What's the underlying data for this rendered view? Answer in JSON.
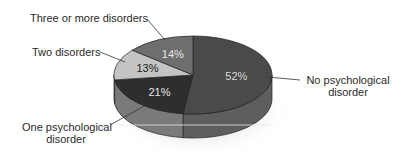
{
  "chart_data": {
    "type": "pie",
    "style": "3d",
    "title": "",
    "slices": [
      {
        "label": "No psychological disorder",
        "value": 52,
        "display": "52%",
        "color": "#4a4a4a",
        "side": "#5e5e5e",
        "text_color": "#d9d9d9"
      },
      {
        "label": "One psychological disorder",
        "value": 21,
        "display": "21%",
        "color": "#2e2e2e",
        "side": "#7a7a7a",
        "text_color": "#e6e6e6"
      },
      {
        "label": "Two disorders",
        "value": 13,
        "display": "13%",
        "color": "#c4c4c4",
        "side": "#9a9a9a",
        "text_color": "#222222"
      },
      {
        "label": "Three or more disorders",
        "value": 14,
        "display": "14%",
        "color": "#6e6e6e",
        "side": "#5a5a5a",
        "text_color": "#e8e8e8"
      }
    ],
    "legend": "callout labels with leader lines"
  },
  "labels": {
    "no_disorder_line1": "No psychological",
    "no_disorder_line2": "disorder",
    "one_disorder_line1": "One psychological",
    "one_disorder_line2": "disorder",
    "two_disorders": "Two disorders",
    "three_or_more": "Three or more disorders"
  }
}
